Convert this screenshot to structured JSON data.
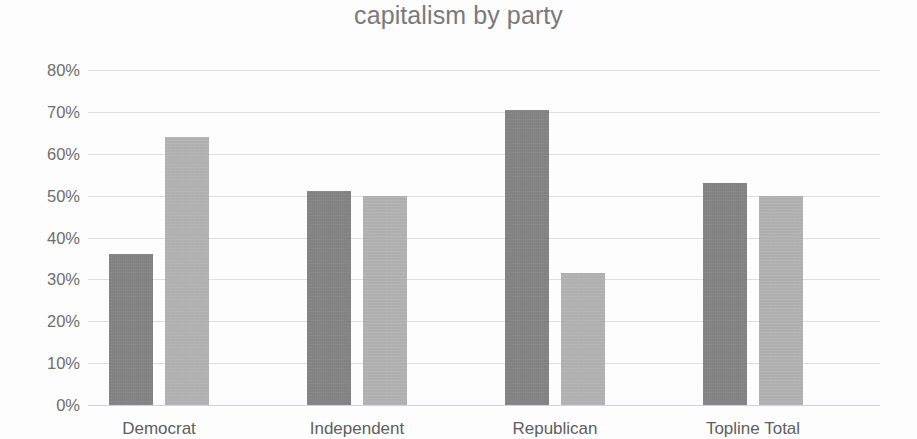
{
  "chart_data": {
    "type": "bar",
    "title": "capitalism by party",
    "xlabel": "",
    "ylabel": "",
    "categories": [
      "Democrat",
      "Independent",
      "Republican",
      "Topline Total"
    ],
    "series": [
      {
        "name": "series-1-dark",
        "color": "#878787",
        "values": [
          36,
          51,
          70.5,
          53
        ]
      },
      {
        "name": "series-2-light",
        "color": "#b6b6b6",
        "values": [
          64,
          50,
          31.5,
          50
        ]
      }
    ],
    "ylim": [
      0,
      80
    ],
    "ytick_labels": [
      "80%",
      "70%",
      "60%",
      "50%",
      "40%",
      "30%",
      "20%",
      "10%",
      "0%"
    ],
    "ytick_values": [
      80,
      70,
      60,
      50,
      40,
      30,
      20,
      10,
      0
    ],
    "grid": true,
    "grid_axis": "y",
    "legend": false,
    "legend_position": "none",
    "background_color": "#ffffff",
    "grid_color": "#d7d9de",
    "text_color": "#6f6f6f"
  }
}
